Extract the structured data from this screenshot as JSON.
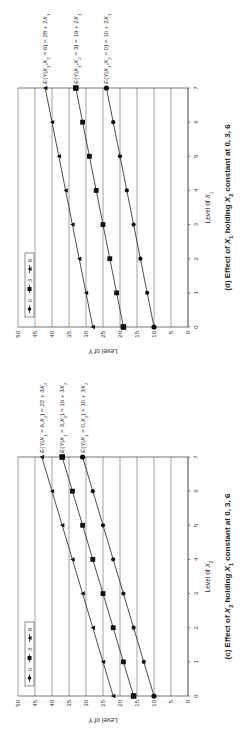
{
  "figure": {
    "orientation": "rotated 90 degrees clockwise",
    "panels": [
      "d",
      "c"
    ]
  },
  "chart_data": [
    {
      "id": "d",
      "type": "line",
      "title": "(d) Effect of X1 holding X2 constant at 0, 3, 6",
      "title_parts": {
        "prefix": "(d) Effect of ",
        "var": "X",
        "var_sub": "1",
        "mid": " holding ",
        "var2": "X",
        "var2_sub": "2",
        "suffix": " constant at 0, 3, 6"
      },
      "xlabel": "Level of X1",
      "xlabel_parts": {
        "text": "Level of ",
        "var": "X",
        "sub": "1"
      },
      "ylabel": "Level of Y",
      "x": [
        0,
        1,
        2,
        3,
        4,
        5,
        6,
        7
      ],
      "xticks": [
        "0",
        "1",
        "2",
        "3",
        "4",
        "5",
        "6",
        "7"
      ],
      "yticks": [
        "0",
        "5",
        "10",
        "15",
        "20",
        "25",
        "30",
        "35",
        "40",
        "45",
        "50"
      ],
      "ylim": [
        0,
        50
      ],
      "xlim": [
        0,
        7
      ],
      "grid": "horizontal",
      "legend": {
        "position": "upper-left inside plot",
        "entries": [
          "0",
          "3",
          "6"
        ]
      },
      "series": [
        {
          "name": "0",
          "marker": "circle",
          "values": [
            10,
            12,
            14,
            16,
            18,
            20,
            22,
            24
          ],
          "equation": "E(Y|X1,X2 = 0) = 10 + 2X1"
        },
        {
          "name": "3",
          "marker": "square",
          "values": [
            19,
            21,
            23,
            25,
            27,
            29,
            31,
            33
          ],
          "equation": "E(Y|X1,X2 = 3) = 19 + 2X1"
        },
        {
          "name": "6",
          "marker": "triangle",
          "values": [
            28,
            30,
            32,
            34,
            36,
            38,
            40,
            42
          ],
          "equation": "E(Y|X1,X2 = 6) = 28 + 2X1"
        }
      ],
      "annotations": [
        "E(Y|X1,X2 = 6) = 28 + 2X1",
        "E(Y|X1,X2 = 3) = 19 + 2X1",
        "E(Y|X1,X2 = 0) = 10 + 2X1"
      ]
    },
    {
      "id": "c",
      "type": "line",
      "title": "(c) Effect of X2 holding X1 constant at 0, 3, 6",
      "title_parts": {
        "prefix": "(c) Effect of ",
        "var": "X",
        "var_sub": "2",
        "mid": " holding ",
        "var2": "X",
        "var2_sub": "1",
        "suffix": " constant at 0, 3, 6"
      },
      "xlabel": "Level of X2",
      "xlabel_parts": {
        "text": "Level of ",
        "var": "X",
        "sub": "2"
      },
      "ylabel": "Level of Y",
      "x": [
        0,
        1,
        2,
        3,
        4,
        5,
        6,
        7
      ],
      "xticks": [
        "0",
        "1",
        "2",
        "3",
        "4",
        "5",
        "6",
        "7"
      ],
      "yticks": [
        "0",
        "5",
        "10",
        "15",
        "20",
        "25",
        "30",
        "35",
        "40",
        "45",
        "50"
      ],
      "ylim": [
        0,
        50
      ],
      "xlim": [
        0,
        7
      ],
      "grid": "horizontal",
      "legend": {
        "position": "upper-left inside plot",
        "entries": [
          "0",
          "3",
          "6"
        ]
      },
      "series": [
        {
          "name": "0",
          "marker": "circle",
          "values": [
            10,
            13,
            16,
            19,
            22,
            25,
            28,
            31
          ],
          "equation": "E(Y|X1 = 0,X2) = 10 + 3X2"
        },
        {
          "name": "3",
          "marker": "square",
          "values": [
            16,
            19,
            22,
            25,
            28,
            31,
            34,
            37
          ],
          "equation": "E(Y|X1 = 3,X2) = 16 + 3X2"
        },
        {
          "name": "6",
          "marker": "triangle",
          "values": [
            22,
            25,
            28,
            31,
            34,
            37,
            40,
            43
          ],
          "equation": "E(Y|X1 = 6,X2) = 22 + 3X2"
        }
      ],
      "annotations": [
        "E(Y|X1 = 6,X2) = 22 + 3X2",
        "E(Y|X1 = 3,X2) = 16 + 3X2",
        "E(Y|X1 = 0,X2) = 10 + 3X2"
      ]
    }
  ]
}
